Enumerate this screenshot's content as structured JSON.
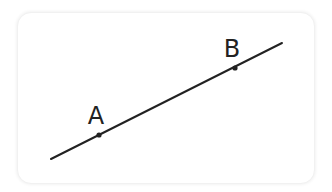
{
  "diagram": {
    "type": "line-with-points",
    "line": {
      "x1": 51,
      "y1": 159,
      "x2": 282,
      "y2": 43,
      "color": "#222222",
      "width": 2
    },
    "points": [
      {
        "label": "A",
        "x": 99,
        "y": 135,
        "label_x": 96,
        "label_y": 124
      },
      {
        "label": "B",
        "x": 235,
        "y": 68,
        "label_x": 232,
        "label_y": 57
      }
    ]
  }
}
